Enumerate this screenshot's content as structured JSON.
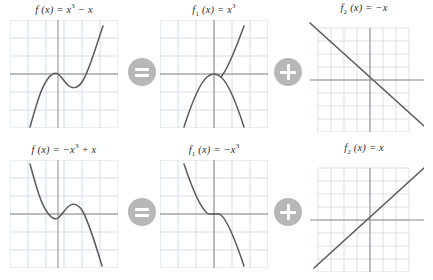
{
  "figure": {
    "background_color": "#ffffff",
    "curve_color": "#5a5a5a",
    "axis_color": "#8a8a8a",
    "grid_color": "#c9d4e2",
    "badge_color": "#b7b7b7",
    "badge_glyph_color": "#ffffff"
  },
  "operators": {
    "equals": {
      "label": "=",
      "icon": "equals-icon"
    },
    "plus": {
      "label": "+",
      "icon": "plus-icon"
    }
  },
  "rows": [
    {
      "id": "row-1",
      "panels": [
        {
          "id": "r1-p1",
          "title_html": "<span class=\"fn\">f</span> (<span class=\"fn\">x</span>) = <span class=\"fn\">x</span><sup>3</sup> &minus; <span class=\"fn\">x</span>",
          "title_text": "f (x) = x3 - x"
        },
        {
          "id": "r1-p2",
          "title_html": "<span class=\"fn\">f</span><sub>1</sub> (<span class=\"fn\">x</span>) = <span class=\"fn\">x</span><sup>3</sup>",
          "title_text": "f1 (x) = x3"
        },
        {
          "id": "r1-p3",
          "title_html": "<span class=\"fn\">f</span><sub>2</sub> (<span class=\"fn\">x</span>) = &minus;<span class=\"fn\">x</span>",
          "title_text": "f2 (x) = -x"
        }
      ]
    },
    {
      "id": "row-2",
      "panels": [
        {
          "id": "r2-p1",
          "title_html": "<span class=\"fn\">f</span> (<span class=\"fn\">x</span>) = &minus;<span class=\"fn\">x</span><sup>3</sup> + <span class=\"fn\">x</span>",
          "title_text": "f (x) = -x3 + x"
        },
        {
          "id": "r2-p2",
          "title_html": "<span class=\"fn\">f</span><sub>1</sub> (<span class=\"fn\">x</span>) = &minus;<span class=\"fn\">x</span><sup>3</sup>",
          "title_text": "f1 (x) = -x3"
        },
        {
          "id": "r2-p3",
          "title_html": "<span class=\"fn\">f</span><sub>2</sub> (<span class=\"fn\">x</span>) = <span class=\"fn\">x</span>",
          "title_text": "f2 (x) = x"
        }
      ]
    }
  ],
  "chart_data": [
    {
      "id": "r1-p1",
      "type": "line",
      "title": "f (x) = x3 - x",
      "expression": "x^3 - x",
      "xlabel": "",
      "ylabel": "",
      "xlim": [
        -3,
        3
      ],
      "ylim": [
        -3.5,
        3.5
      ],
      "grid": true,
      "grid_step": 1,
      "legend": "none",
      "x": [
        -2.0,
        -1.75,
        -1.5,
        -1.25,
        -1.0,
        -0.75,
        -0.5,
        -0.25,
        0.0,
        0.25,
        0.5,
        0.75,
        1.0,
        1.25,
        1.5,
        1.75,
        2.0
      ],
      "y": [
        -6.0,
        -3.61,
        -1.88,
        -0.7,
        0.0,
        0.33,
        0.38,
        0.23,
        0.0,
        -0.23,
        -0.38,
        -0.33,
        0.0,
        0.7,
        1.88,
        3.61,
        6.0
      ],
      "roots": [
        -1,
        0,
        1
      ],
      "local_max": {
        "x": -0.577,
        "y": 0.385
      },
      "local_min": {
        "x": 0.577,
        "y": -0.385
      }
    },
    {
      "id": "r1-p2",
      "type": "line",
      "title": "f1 (x) = x3",
      "expression": "x^3",
      "xlabel": "",
      "ylabel": "",
      "xlim": [
        -3,
        3
      ],
      "ylim": [
        -3.5,
        3.5
      ],
      "grid": true,
      "grid_step": 1,
      "legend": "none",
      "x": [
        -1.6,
        -1.4,
        -1.2,
        -1.0,
        -0.8,
        -0.6,
        -0.4,
        -0.2,
        0.0,
        0.2,
        0.4,
        0.6,
        0.8,
        1.0,
        1.2,
        1.4,
        1.6
      ],
      "y": [
        -4.1,
        -2.74,
        -1.73,
        -1.0,
        -0.51,
        -0.22,
        -0.06,
        -0.01,
        0.0,
        0.01,
        0.06,
        0.22,
        0.51,
        1.0,
        1.73,
        2.74,
        4.1
      ],
      "roots": [
        0
      ],
      "inflection": {
        "x": 0,
        "y": 0
      }
    },
    {
      "id": "r1-p3",
      "type": "line",
      "title": "f2 (x) = -x",
      "expression": "-x",
      "xlabel": "",
      "ylabel": "",
      "xlim": [
        -3.5,
        3.5
      ],
      "ylim": [
        -3.5,
        3.5
      ],
      "grid": true,
      "grid_step": 0.5,
      "legend": "none",
      "x": [
        -3.5,
        3.5
      ],
      "y": [
        3.5,
        -3.5
      ],
      "slope": -1,
      "intercept": 0,
      "roots": [
        0
      ]
    },
    {
      "id": "r2-p1",
      "type": "line",
      "title": "f (x) = -x3 + x",
      "expression": "-x^3 + x",
      "xlabel": "",
      "ylabel": "",
      "xlim": [
        -3,
        3
      ],
      "ylim": [
        -3.5,
        3.5
      ],
      "grid": true,
      "grid_step": 1,
      "legend": "none",
      "x": [
        -2.0,
        -1.75,
        -1.5,
        -1.25,
        -1.0,
        -0.75,
        -0.5,
        -0.25,
        0.0,
        0.25,
        0.5,
        0.75,
        1.0,
        1.25,
        1.5,
        1.75,
        2.0
      ],
      "y": [
        6.0,
        3.61,
        1.88,
        0.7,
        0.0,
        -0.33,
        -0.38,
        -0.23,
        0.0,
        0.23,
        0.38,
        0.33,
        0.0,
        -0.7,
        -1.88,
        -3.61,
        -6.0
      ],
      "roots": [
        -1,
        0,
        1
      ],
      "local_min": {
        "x": -0.577,
        "y": -0.385
      },
      "local_max": {
        "x": 0.577,
        "y": 0.385
      }
    },
    {
      "id": "r2-p2",
      "type": "line",
      "title": "f1 (x) = -x3",
      "expression": "-x^3",
      "xlabel": "",
      "ylabel": "",
      "xlim": [
        -3,
        3
      ],
      "ylim": [
        -3.5,
        3.5
      ],
      "grid": true,
      "grid_step": 1,
      "legend": "none",
      "x": [
        -1.6,
        -1.4,
        -1.2,
        -1.0,
        -0.8,
        -0.6,
        -0.4,
        -0.2,
        0.0,
        0.2,
        0.4,
        0.6,
        0.8,
        1.0,
        1.2,
        1.4,
        1.6
      ],
      "y": [
        4.1,
        2.74,
        1.73,
        1.0,
        0.51,
        0.22,
        0.06,
        0.01,
        0.0,
        -0.01,
        -0.06,
        -0.22,
        -0.51,
        -1.0,
        -1.73,
        -2.74,
        -4.1
      ],
      "roots": [
        0
      ],
      "inflection": {
        "x": 0,
        "y": 0
      }
    },
    {
      "id": "r2-p3",
      "type": "line",
      "title": "f2 (x) = x",
      "expression": "x",
      "xlabel": "",
      "ylabel": "",
      "xlim": [
        -3.5,
        3.5
      ],
      "ylim": [
        -3.5,
        3.5
      ],
      "grid": true,
      "grid_step": 0.5,
      "legend": "none",
      "x": [
        -3.5,
        3.5
      ],
      "y": [
        -3.5,
        3.5
      ],
      "slope": 1,
      "intercept": 0,
      "roots": [
        0
      ]
    }
  ]
}
